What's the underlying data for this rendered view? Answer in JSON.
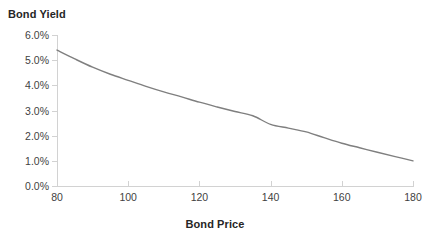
{
  "chart_data": {
    "type": "line",
    "title": "",
    "xlabel": "Bond Price",
    "ylabel": "Bond Yield",
    "xlim": [
      80,
      180
    ],
    "ylim": [
      0,
      6
    ],
    "grid": false,
    "legend": false,
    "legend_position": "none",
    "series_color": "#7f7f7f",
    "x": [
      80,
      85,
      90,
      95,
      100,
      105,
      110,
      115,
      120,
      125,
      130,
      135,
      140,
      145,
      150,
      155,
      160,
      165,
      170,
      175,
      180
    ],
    "series": [
      {
        "name": "Bond Yield",
        "values": [
          5.4,
          5.05,
          4.72,
          4.44,
          4.2,
          3.96,
          3.74,
          3.54,
          3.33,
          3.14,
          2.96,
          2.79,
          2.45,
          2.3,
          2.15,
          1.92,
          1.7,
          1.52,
          1.34,
          1.17,
          1.0
        ]
      }
    ],
    "xticks": [
      80,
      100,
      120,
      140,
      160,
      180
    ],
    "xticklabels": [
      "80",
      "100",
      "120",
      "140",
      "160",
      "180"
    ],
    "yticks": [
      0,
      1,
      2,
      3,
      4,
      5,
      6
    ],
    "yticklabels": [
      "0.0%",
      "1.0%",
      "2.0%",
      "3.0%",
      "4.0%",
      "5.0%",
      "6.0%"
    ]
  }
}
